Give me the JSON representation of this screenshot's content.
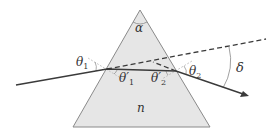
{
  "diagram": {
    "colors": {
      "prism_fill": "#e6e6e6",
      "prism_stroke": "#8a8a8a",
      "ray": "#3a3a3a",
      "dashed": "#3a3a3a",
      "normal_lines": "#b0b0b0",
      "angle_arcs": "#888888"
    },
    "labels": {
      "apex_angle": "α",
      "theta1": "θ",
      "theta1_sub": "1",
      "theta1_prime": "θ′",
      "theta1_prime_sub": "1",
      "theta2_prime": "θ′",
      "theta2_prime_sub": "2",
      "theta2": "θ",
      "theta2_sub": "2",
      "deviation": "δ",
      "refractive_index": "n"
    }
  }
}
